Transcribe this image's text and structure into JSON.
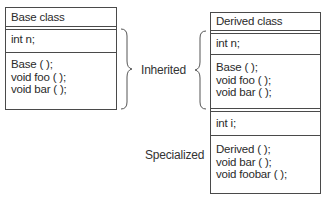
{
  "base_class": {
    "title": "Base class",
    "fields": [
      "int n;"
    ],
    "methods": [
      "Base ( );",
      "void foo ( );",
      "void bar ( );"
    ]
  },
  "derived_class": {
    "title": "Derived class",
    "inherited_fields": [
      "int n;"
    ],
    "inherited_methods": [
      "Base ( );",
      "void foo ( );",
      "void bar ( );"
    ],
    "specialized_fields": [
      "int i;"
    ],
    "specialized_methods": [
      "Derived ( );",
      "void bar ( );",
      "void foobar ( );"
    ]
  },
  "labels": {
    "inherited": "Inherited",
    "specialized": "Specialized"
  }
}
